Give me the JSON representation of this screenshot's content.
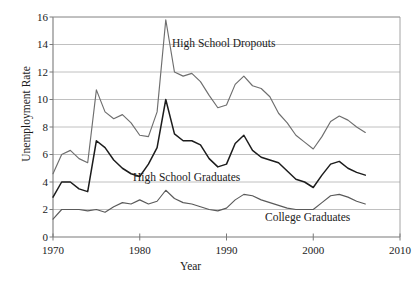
{
  "axes": {
    "ylabel": "Unemployment Rate",
    "xlabel": "Year",
    "y_ticks": [
      "0",
      "2",
      "4",
      "6",
      "8",
      "10",
      "12",
      "14",
      "16"
    ],
    "x_ticks": [
      "1970",
      "1980",
      "1990",
      "2000",
      "2010"
    ]
  },
  "annotations": {
    "dropouts": "High School Dropouts",
    "hs_graduates": "High School Graduates",
    "college_graduates": "College Graduates"
  },
  "colors": {
    "dropouts_line": "#6e6e6e",
    "hs_graduates_line": "#1c1c1c",
    "college_graduates_line": "#5a5a5a",
    "gridline": "#b9b9b9",
    "axis": "#7a7a7a",
    "frame": "#9a9a9a"
  },
  "chart_data": {
    "type": "line",
    "title": "",
    "xlabel": "Year",
    "ylabel": "Unemployment Rate",
    "xlim": [
      1970,
      2010
    ],
    "ylim": [
      0,
      16
    ],
    "ytick_step": 2,
    "xtick_step": 10,
    "grid": "horizontal",
    "legend": "inline-annotations",
    "x": [
      1970,
      1971,
      1972,
      1973,
      1974,
      1975,
      1976,
      1977,
      1978,
      1979,
      1980,
      1981,
      1982,
      1983,
      1984,
      1985,
      1986,
      1987,
      1988,
      1989,
      1990,
      1991,
      1992,
      1993,
      1994,
      1995,
      1996,
      1997,
      1998,
      1999,
      2000,
      2001,
      2002,
      2003,
      2004,
      2005,
      2006
    ],
    "series": [
      {
        "name": "High School Dropouts",
        "color": "#6e6e6e",
        "values": [
          4.6,
          6.0,
          6.3,
          5.7,
          5.4,
          10.7,
          9.1,
          8.6,
          8.9,
          8.3,
          7.4,
          7.3,
          9.1,
          15.8,
          12.0,
          11.7,
          11.9,
          11.3,
          10.3,
          9.4,
          9.6,
          11.1,
          11.7,
          11.0,
          10.8,
          10.2,
          9.0,
          8.3,
          7.4,
          6.9,
          6.4,
          7.3,
          8.4,
          8.8,
          8.5,
          8.0,
          7.6
        ]
      },
      {
        "name": "High School Graduates",
        "color": "#1c1c1c",
        "values": [
          2.9,
          4.0,
          4.0,
          3.5,
          3.3,
          7.0,
          6.5,
          5.6,
          5.0,
          4.6,
          4.4,
          5.3,
          6.5,
          10.0,
          7.5,
          7.0,
          7.0,
          6.7,
          5.7,
          5.1,
          5.3,
          6.8,
          7.4,
          6.3,
          5.8,
          5.6,
          5.4,
          4.8,
          4.2,
          4.0,
          3.6,
          4.5,
          5.3,
          5.5,
          5.0,
          4.7,
          4.5
        ]
      },
      {
        "name": "College Graduates",
        "color": "#5a5a5a",
        "values": [
          1.3,
          2.0,
          2.0,
          2.0,
          1.9,
          2.0,
          1.8,
          2.2,
          2.5,
          2.4,
          2.7,
          2.4,
          2.6,
          3.4,
          2.8,
          2.5,
          2.4,
          2.2,
          2.0,
          1.9,
          2.1,
          2.7,
          3.1,
          3.0,
          2.7,
          2.5,
          2.3,
          2.1,
          2.0,
          2.0,
          2.0,
          2.5,
          3.0,
          3.1,
          2.9,
          2.6,
          2.4
        ]
      }
    ]
  },
  "geometry": {
    "plot_left": 53,
    "plot_right": 400,
    "plot_top": 17,
    "plot_bottom": 237
  }
}
